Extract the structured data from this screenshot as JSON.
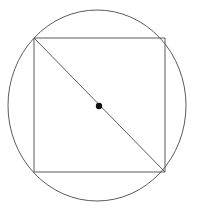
{
  "figure": {
    "background_color": "#ffffff",
    "width": 199,
    "height": 213,
    "stroke_color": "#5a5a5a",
    "stroke_width": 1,
    "dot_color": "#111111"
  },
  "chart_data": {
    "type": "diagram",
    "xlabel": "",
    "ylabel": "",
    "xlim": [
      0,
      199
    ],
    "ylim": [
      0,
      213
    ],
    "grid": false,
    "legend": "none",
    "shapes": [
      {
        "name": "circle",
        "kind": "ellipse",
        "cx": 97,
        "cy": 105.5,
        "rx": 89,
        "ry": 95.5,
        "stroke": "#5a5a5a",
        "stroke_width": 1,
        "fill": "none"
      },
      {
        "name": "square",
        "kind": "rect",
        "x": 34,
        "y": 38,
        "width": 131,
        "height": 134,
        "stroke": "#5a5a5a",
        "stroke_width": 1,
        "fill": "none",
        "corners": [
          [
            34,
            38
          ],
          [
            165,
            38
          ],
          [
            165,
            172
          ],
          [
            34,
            172
          ]
        ]
      },
      {
        "name": "diagonal",
        "kind": "line",
        "x1": 34,
        "y1": 38,
        "x2": 165,
        "y2": 172,
        "stroke": "#5a5a5a",
        "stroke_width": 1
      },
      {
        "name": "center-point",
        "kind": "dot",
        "cx": 99,
        "cy": 106,
        "r": 3.2,
        "fill": "#111111"
      }
    ],
    "annotations": []
  }
}
